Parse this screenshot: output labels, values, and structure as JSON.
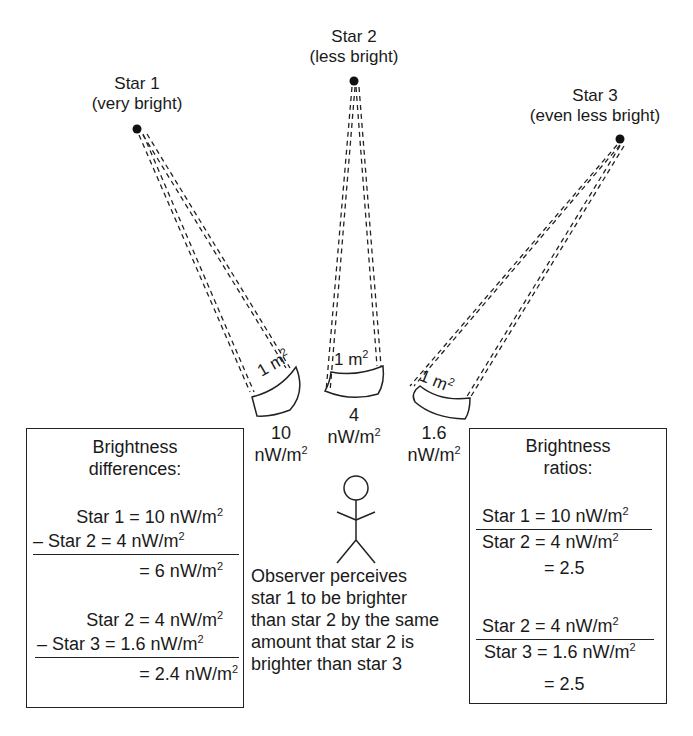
{
  "stars": [
    {
      "name": "Star 1",
      "desc": "(very bright)",
      "flux_value": "10",
      "flux_unit": "nW/m",
      "flux_exp": "2",
      "detector_label": "1 m",
      "detector_exp": "2"
    },
    {
      "name": "Star 2",
      "desc": "(less bright)",
      "flux_value": "4",
      "flux_unit": "nW/m",
      "flux_exp": "2",
      "detector_label": "1 m",
      "detector_exp": "2"
    },
    {
      "name": "Star 3",
      "desc": "(even less bright)",
      "flux_value": "1.6",
      "flux_unit": "nW/m",
      "flux_exp": "2",
      "detector_label": "1 m",
      "detector_exp": "2"
    }
  ],
  "differences_box": {
    "title_line1": "Brightness",
    "title_line2": "differences:",
    "group1": {
      "line1": "Star 1 = 10 nW/m",
      "line2": "– Star 2 =   4 nW/m",
      "result": "=   6 nW/m"
    },
    "group2": {
      "line1": "Star 2 =  4 nW/m",
      "line2": "– Star 3 =  1.6 nW/m",
      "result": "=  2.4 nW/m"
    },
    "exp": "2"
  },
  "ratios_box": {
    "title_line1": "Brightness",
    "title_line2": "ratios:",
    "group1": {
      "numerator": "Star 1 = 10 nW/m",
      "denominator": "Star 2 =   4 nW/m",
      "result": "= 2.5"
    },
    "group2": {
      "numerator": "Star 2 =   4 nW/m",
      "denominator": "Star 3 = 1.6 nW/m",
      "result": "= 2.5"
    },
    "exp": "2"
  },
  "observer": {
    "lines": [
      "Observer perceives",
      "star 1 to be brighter",
      "than star 2 by the same",
      "amount that star 2 is",
      "brighter than star 3"
    ]
  },
  "colors": {
    "ink": "#1a1a1a",
    "background": "#ffffff"
  }
}
